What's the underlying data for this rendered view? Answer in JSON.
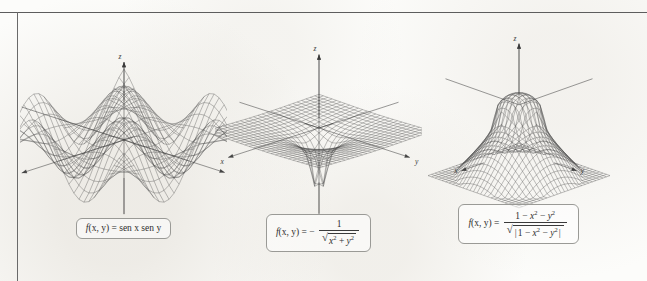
{
  "figure": {
    "kind": "textbook-figure",
    "background_color": "#fcfcfa",
    "ink_color": "#3a3a3a",
    "rule_color": "#5d5d5d",
    "caption_border_color": "#9a9a96",
    "axis_labels": {
      "x": "x",
      "y": "y",
      "z": "z"
    }
  },
  "chart_data": [
    {
      "id": "plot-1",
      "type": "surface",
      "title": "",
      "formula_text": "f(x, y) = sen x sen y",
      "formula_parts": {
        "lhs_f": "f",
        "lhs_args": "(x, y)",
        "equals": "=",
        "rhs": "sen x sen y"
      },
      "expression": "sin(x)*sin(y)",
      "xlabel": "x",
      "ylabel": "y",
      "zlabel": "z",
      "xlim": [
        -4.2,
        4.2
      ],
      "ylim": [
        -4.2,
        4.2
      ],
      "zlim": [
        -1.0,
        1.0
      ],
      "grid": true,
      "mesh_n": 26,
      "legend": "none",
      "description": "Egg-carton saddle surface of sen x sen y with alternating peaks and valleys",
      "axis_arrow_dirs": {
        "x": "down-left",
        "y": "right",
        "z": "up"
      }
    },
    {
      "id": "plot-2",
      "type": "surface",
      "title": "",
      "formula_text": "f(x, y) = - 1 / sqrt(x^2 + y^2)",
      "formula_parts": {
        "lhs_f": "f",
        "lhs_args": "(x, y)",
        "equals": "=",
        "minus": "−",
        "numerator": "1",
        "radicand_a": "x",
        "radicand_a_exp": "2",
        "plus": "+",
        "radicand_b": "y",
        "radicand_b_exp": "2"
      },
      "expression": "-1/sqrt(x^2+y^2)",
      "xlabel": "x",
      "ylabel": "y",
      "zlabel": "z",
      "xlim": [
        -4.0,
        4.0
      ],
      "ylim": [
        -4.0,
        4.0
      ],
      "zlim": [
        -3.0,
        0.0
      ],
      "grid": true,
      "mesh_n": 26,
      "legend": "none",
      "description": "Flat sheet with a deep downward funnel singularity at the origin",
      "axis_arrow_dirs": {
        "x": "down-left",
        "y": "down-right",
        "z": "up"
      }
    },
    {
      "id": "plot-3",
      "type": "surface",
      "title": "",
      "formula_text": "f(x, y) = (1 - x^2 - y^2) / sqrt(|1 - x^2 - y^2|)",
      "formula_parts": {
        "lhs_f": "f",
        "lhs_args": "(x, y)",
        "equals": "=",
        "num_one": "1",
        "num_minus_a": "−",
        "num_x": "x",
        "num_x_exp": "2",
        "num_minus_b": "−",
        "num_y": "y",
        "num_y_exp": "2",
        "den_bar_open": "|",
        "den_one": "1",
        "den_minus_a": "−",
        "den_x": "x",
        "den_x_exp": "2",
        "den_minus_b": "−",
        "den_y": "y",
        "den_y_exp": "2",
        "den_bar_close": "|"
      },
      "expression": "(1-x^2-y^2)/sqrt(abs(1-x^2-y^2))",
      "xlabel": "x",
      "ylabel": "y",
      "zlabel": "z",
      "xlim": [
        -2.6,
        2.6
      ],
      "ylim": [
        -2.6,
        2.6
      ],
      "zlim": [
        -2.2,
        1.0
      ],
      "grid": true,
      "mesh_n": 26,
      "legend": "none",
      "description": "Central rounded peak with four downward-sweeping corner skirts",
      "axis_arrow_dirs": {
        "x": "left",
        "y": "right",
        "z": "up"
      }
    }
  ]
}
